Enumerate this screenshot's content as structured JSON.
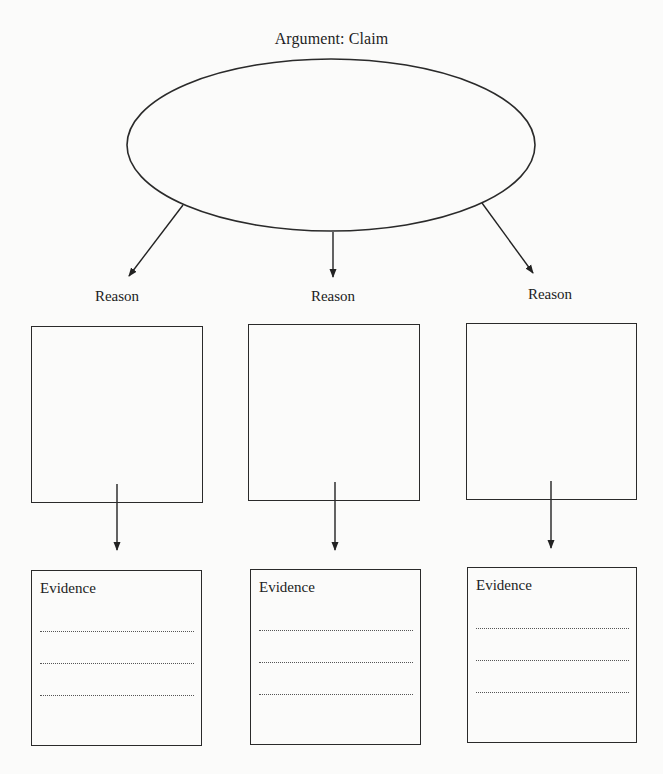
{
  "diagram": {
    "title": "Argument: Claim",
    "claim": {
      "shape": "ellipse",
      "text": ""
    },
    "reasons": [
      {
        "label": "Reason",
        "box_text": "",
        "evidence": {
          "label": "Evidence",
          "lines": [
            "",
            "",
            ""
          ]
        }
      },
      {
        "label": "Reason",
        "box_text": "",
        "evidence": {
          "label": "Evidence",
          "lines": [
            "",
            "",
            ""
          ]
        }
      },
      {
        "label": "Reason",
        "box_text": "",
        "evidence": {
          "label": "Evidence",
          "lines": [
            "",
            "",
            ""
          ]
        }
      }
    ],
    "colors": {
      "background": "#fbfbfa",
      "stroke": "#2a2a2a",
      "text": "#222222",
      "dotted_line": "#555555"
    }
  }
}
